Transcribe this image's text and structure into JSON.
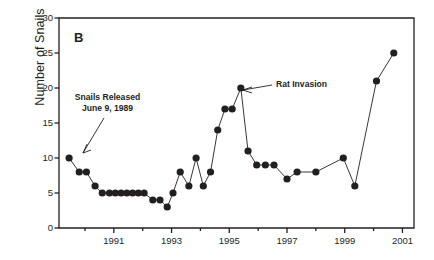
{
  "figure": {
    "panel_label": "B",
    "background": "#ffffff",
    "ink": "#231f20"
  },
  "annotations": [
    {
      "name": "snails-released",
      "line1": "Snails Released",
      "line2": "June 9, 1989"
    },
    {
      "name": "rat-invasion",
      "line1": "Rat Invasion"
    }
  ],
  "chart_data": {
    "type": "line",
    "title": "",
    "xlabel": "",
    "ylabel": "Number of Snails",
    "xlim": [
      1989.1,
      2001.4
    ],
    "ylim": [
      0,
      30
    ],
    "grid": false,
    "legend": null,
    "marker": "filled-circle",
    "yticks": [
      0,
      5,
      10,
      15,
      20,
      25,
      30
    ],
    "ytick_labels": [
      "0",
      "5",
      "10",
      "15",
      "20",
      "25",
      "30"
    ],
    "xticks": [
      1991,
      1993,
      1995,
      1997,
      1999,
      2001
    ],
    "xtick_labels": [
      "1991",
      "1993",
      "1995",
      "1997",
      "1999",
      "2001"
    ],
    "xminor_ticks": [
      1990,
      1992,
      1994,
      1996,
      1998,
      2000
    ],
    "series": [
      {
        "name": "Number of Snails",
        "x": [
          1989.45,
          1989.8,
          1990.05,
          1990.35,
          1990.6,
          1990.85,
          1991.05,
          1991.25,
          1991.45,
          1991.65,
          1991.85,
          1992.05,
          1992.35,
          1992.6,
          1992.85,
          1993.05,
          1993.3,
          1993.6,
          1993.85,
          1994.1,
          1994.35,
          1994.6,
          1994.85,
          1995.1,
          1995.4,
          1995.65,
          1995.95,
          1996.25,
          1996.55,
          1997.0,
          1997.35,
          1998.0,
          1998.95,
          1999.35,
          2000.1,
          2000.7
        ],
        "y": [
          10,
          8,
          8,
          6,
          5,
          5,
          5,
          5,
          5,
          5,
          5,
          5,
          4,
          4,
          3,
          5,
          8,
          6,
          10,
          6,
          8,
          14,
          17,
          17,
          20,
          11,
          9,
          9,
          9,
          7,
          8,
          8,
          10,
          6,
          21,
          25
        ]
      }
    ]
  }
}
